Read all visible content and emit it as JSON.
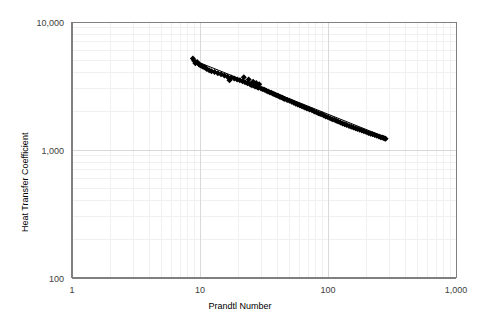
{
  "chart_data": {
    "type": "scatter",
    "title": "",
    "xlabel": "Prandtl Number",
    "ylabel": "Heat Transfer Coefficient",
    "xscale": "log",
    "yscale": "log",
    "xlim": [
      1,
      1000
    ],
    "ylim": [
      100,
      10000
    ],
    "x_tick_labels": [
      "1",
      "10",
      "100",
      "1,000"
    ],
    "x_tick_values": [
      1,
      10,
      100,
      1000
    ],
    "y_tick_labels": [
      "100",
      "1,000",
      "10,000"
    ],
    "y_tick_values": [
      100,
      1000,
      10000
    ],
    "grid": "major-and-minor-faint",
    "legend": "none",
    "marker": "diamond",
    "marker_color": "#000000",
    "marker_size": 3,
    "trendline": {
      "type": "power-law",
      "color": "#000000",
      "width": 1,
      "x_start": 8.8,
      "y_start": 5050,
      "x_end": 280,
      "y_end": 1260
    },
    "series": [
      {
        "name": "Heat Transfer Coefficient vs Prandtl Number",
        "points": [
          [
            8.8,
            5180
          ],
          [
            9.0,
            4980
          ],
          [
            9.2,
            4760
          ],
          [
            9.5,
            4880
          ],
          [
            9.8,
            4680
          ],
          [
            10.0,
            4620
          ],
          [
            10.2,
            4560
          ],
          [
            10.5,
            4500
          ],
          [
            10.8,
            4440
          ],
          [
            11.0,
            4400
          ],
          [
            11.3,
            4300
          ],
          [
            11.8,
            4200
          ],
          [
            12.3,
            4130
          ],
          [
            13.0,
            4060
          ],
          [
            13.8,
            3980
          ],
          [
            14.6,
            3900
          ],
          [
            15.5,
            3820
          ],
          [
            16.4,
            3740
          ],
          [
            17.0,
            3500
          ],
          [
            17.5,
            3680
          ],
          [
            18.5,
            3620
          ],
          [
            19.5,
            3560
          ],
          [
            20.5,
            3500
          ],
          [
            21.5,
            3440
          ],
          [
            22.0,
            3700
          ],
          [
            22.5,
            3380
          ],
          [
            23.5,
            3320
          ],
          [
            24.0,
            3560
          ],
          [
            24.5,
            3280
          ],
          [
            25.0,
            3240
          ],
          [
            25.5,
            3200
          ],
          [
            26.0,
            3420
          ],
          [
            26.5,
            3170
          ],
          [
            27.0,
            3130
          ],
          [
            27.5,
            3340
          ],
          [
            28.0,
            3100
          ],
          [
            28.5,
            3060
          ],
          [
            29.0,
            3260
          ],
          [
            30.0,
            3020
          ],
          [
            31.0,
            2980
          ],
          [
            32.0,
            2950
          ],
          [
            33.0,
            2900
          ],
          [
            34.0,
            2870
          ],
          [
            35.0,
            2830
          ],
          [
            36.0,
            2800
          ],
          [
            37.0,
            2760
          ],
          [
            38.0,
            2730
          ],
          [
            39.0,
            2700
          ],
          [
            40.0,
            2670
          ],
          [
            41.0,
            2640
          ],
          [
            42.0,
            2610
          ],
          [
            43.0,
            2580
          ],
          [
            44.0,
            2560
          ],
          [
            45.0,
            2530
          ],
          [
            46.0,
            2500
          ],
          [
            48.0,
            2460
          ],
          [
            50.0,
            2420
          ],
          [
            52.0,
            2380
          ],
          [
            54.0,
            2340
          ],
          [
            56.0,
            2300
          ],
          [
            58.0,
            2270
          ],
          [
            60.0,
            2240
          ],
          [
            62.0,
            2210
          ],
          [
            64.0,
            2180
          ],
          [
            66.0,
            2150
          ],
          [
            68.0,
            2120
          ],
          [
            70.0,
            2100
          ],
          [
            72.0,
            2070
          ],
          [
            75.0,
            2040
          ],
          [
            78.0,
            2000
          ],
          [
            81.0,
            1970
          ],
          [
            84.0,
            1940
          ],
          [
            87.0,
            1910
          ],
          [
            90.0,
            1890
          ],
          [
            93.0,
            1860
          ],
          [
            96.0,
            1830
          ],
          [
            100.0,
            1800
          ],
          [
            104.0,
            1770
          ],
          [
            108.0,
            1740
          ],
          [
            112.0,
            1720
          ],
          [
            116.0,
            1690
          ],
          [
            120.0,
            1670
          ],
          [
            125.0,
            1640
          ],
          [
            130.0,
            1610
          ],
          [
            135.0,
            1590
          ],
          [
            140.0,
            1570
          ],
          [
            146.0,
            1540
          ],
          [
            152.0,
            1520
          ],
          [
            158.0,
            1500
          ],
          [
            164.0,
            1480
          ],
          [
            170.0,
            1460
          ],
          [
            177.0,
            1440
          ],
          [
            184.0,
            1420
          ],
          [
            191.0,
            1400
          ],
          [
            199.0,
            1380
          ],
          [
            207.0,
            1360
          ],
          [
            215.0,
            1340
          ],
          [
            223.0,
            1325
          ],
          [
            232.0,
            1310
          ],
          [
            241.0,
            1290
          ],
          [
            250.0,
            1275
          ],
          [
            258.0,
            1260
          ],
          [
            265.0,
            1250
          ],
          [
            272.0,
            1240
          ],
          [
            278.0,
            1230
          ],
          [
            282.0,
            1225
          ]
        ]
      }
    ]
  },
  "axes": {
    "y_title": "Heat Transfer Coefficient",
    "x_title": "Prandtl Number",
    "y_labels": {
      "top": "10,000",
      "mid": "1,000",
      "bottom": "100"
    },
    "x_labels": {
      "d1": "1",
      "d2": "10",
      "d3": "100",
      "d4": "1,000"
    }
  },
  "style": {
    "background": "#ffffff",
    "axis_color": "#808080",
    "major_grid_color": "#d9d9d9",
    "minor_grid_color": "#f0f0f0",
    "data_color": "#000000",
    "text_color": "#404040"
  }
}
